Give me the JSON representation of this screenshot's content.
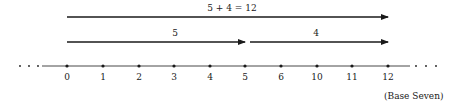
{
  "diagram": {
    "type": "number-line-addition",
    "sum_arrow": {
      "label": "5 + 4 = 12",
      "from": "0",
      "to": "12"
    },
    "addend_arrows": [
      {
        "label": "5",
        "from": "0",
        "to": "5"
      },
      {
        "label": "4",
        "from": "5",
        "to": "12"
      }
    ],
    "ticks": [
      "0",
      "1",
      "2",
      "3",
      "4",
      "5",
      "6",
      "10",
      "11",
      "12"
    ],
    "left_ellipsis": "· · ·",
    "right_ellipsis": "· · ·",
    "base_note": "(Base Seven)",
    "colors": {
      "line": "#1a1a1a",
      "background": "#ffffff"
    }
  }
}
